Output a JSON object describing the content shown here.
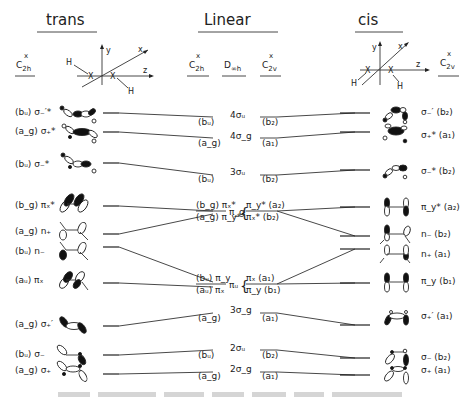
{
  "headers": {
    "trans": "trans",
    "linear": "Linear",
    "cis": "cis"
  },
  "point_groups": {
    "trans": {
      "main": "C",
      "sub": "2h",
      "sup": "x"
    },
    "linear_c2h": {
      "main": "C",
      "sub": "2h",
      "sup": "x"
    },
    "linear_dinfh": {
      "main": "D",
      "sub": "∞h"
    },
    "linear_c2v": {
      "main": "C",
      "sub": "2v",
      "sup": "x"
    },
    "cis": {
      "main": "C",
      "sub": "2v",
      "sup": "x"
    }
  },
  "axes": {
    "trans": {
      "y": "y",
      "x": "x",
      "z": "z",
      "atom": "X",
      "h": "H"
    },
    "cis": {
      "y": "y",
      "x": "x",
      "z": "z",
      "atom": "X",
      "h": "H"
    }
  },
  "trans_levels": [
    {
      "sym": "(bᵤ)",
      "orb": "σ₋′*"
    },
    {
      "sym": "(a_g)",
      "orb": "σ₊*"
    },
    {
      "sym": "(bᵤ)",
      "orb": "σ₋*"
    },
    {
      "sym": "(b_g)",
      "orb": "πₓ*"
    },
    {
      "sym": "(a_g)",
      "orb": "n₊"
    },
    {
      "sym": "(bᵤ)",
      "orb": "n₋"
    },
    {
      "sym": "(aᵤ)",
      "orb": "πₓ"
    },
    {
      "sym": "(a_g)",
      "orb": "σ₊′"
    },
    {
      "sym": "(bᵤ)",
      "orb": "σ₋"
    },
    {
      "sym": "(a_g)",
      "orb": "σ₊"
    }
  ],
  "linear_levels": [
    {
      "c2h": "(bᵤ)",
      "dinfh": "4σᵤ",
      "c2v": "(b₂)"
    },
    {
      "c2h": "(a_g)",
      "dinfh": "4σ_g",
      "c2v": "(a₁)"
    },
    {
      "c2h": "(bᵤ)",
      "dinfh": "3σᵤ",
      "c2v": "(b₂)"
    },
    {
      "c2h_top": "(b_g) πₓ*",
      "c2h_bot": "(a_g) π_y*",
      "dinfh": "π_g",
      "c2v_top": "π_y* (a₂)",
      "c2v_bot": "πₓ* (b₂)"
    },
    {
      "c2h_top": "(bᵤ) π_y",
      "c2h_bot": "(aᵤ) πₓ",
      "dinfh": "πᵤ",
      "c2v_top": "πₓ (a₁)",
      "c2v_bot": "π_y (b₁)"
    },
    {
      "c2h": "(a_g)",
      "dinfh": "3σ_g",
      "c2v": "(a₁)"
    },
    {
      "c2h": "(bᵤ)",
      "dinfh": "2σᵤ",
      "c2v": "(b₂)"
    },
    {
      "c2h": "(a_g)",
      "dinfh": "2σ_g",
      "c2v": "(a₁)"
    }
  ],
  "cis_levels": [
    {
      "orb": "σ₋′",
      "sym": "(b₂)"
    },
    {
      "orb": "σ₊*",
      "sym": "(a₁)"
    },
    {
      "orb": "σ₋*",
      "sym": "(b₂)"
    },
    {
      "orb": "π_y*",
      "sym": "(a₂)"
    },
    {
      "orb": "n₋",
      "sym": "(b₂)"
    },
    {
      "orb": "n₊",
      "sym": "(a₁)"
    },
    {
      "orb": "π_y",
      "sym": "(b₁)"
    },
    {
      "orb": "σ₊′",
      "sym": "(a₁)"
    },
    {
      "orb": "σ₋",
      "sym": "(b₂)"
    },
    {
      "orb": "σ₊",
      "sym": "(a₁)"
    }
  ],
  "caption": ""
}
